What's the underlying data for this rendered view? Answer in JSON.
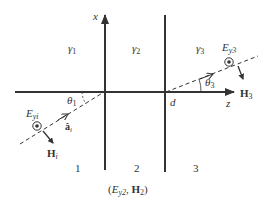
{
  "diagram": {
    "type": "oblique-incidence-multilayer",
    "axes": {
      "vertical_label": "x",
      "horizontal_label": "z",
      "interface_label": "d"
    },
    "media": [
      {
        "region": "1",
        "gamma": "γ",
        "gamma_sub": "1"
      },
      {
        "region": "2",
        "gamma": "γ",
        "gamma_sub": "2"
      },
      {
        "region": "3",
        "gamma": "γ",
        "gamma_sub": "3"
      }
    ],
    "incident": {
      "angle": "θ",
      "angle_sub": "1",
      "e_field": "E",
      "e_field_sub": "yi",
      "h_field": "H",
      "h_field_sub": "i",
      "unit_vector": "â",
      "unit_vector_sub": "i"
    },
    "transmitted": {
      "angle": "θ",
      "angle_sub": "3",
      "e_field": "E",
      "e_field_sub": "y3",
      "h_field": "H",
      "h_field_sub": "3"
    },
    "middle_fields": {
      "open": "(",
      "e": "E",
      "e_sub": "y2",
      "sep": ", ",
      "h": "H",
      "h_sub": "2",
      "close": ")"
    },
    "colors": {
      "line": "#333333",
      "background": "#ffffff"
    }
  }
}
